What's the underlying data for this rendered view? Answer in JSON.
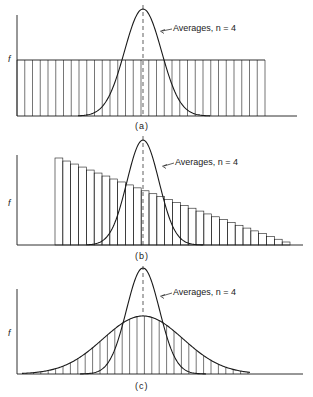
{
  "panels": [
    {
      "id": "a",
      "caption": "(a)",
      "y_label": "f",
      "annotation": "Averages, n = 4",
      "distribution": "uniform"
    },
    {
      "id": "b",
      "caption": "(b)",
      "y_label": "f",
      "annotation": "Averages, n = 4",
      "distribution": "skewed-decreasing"
    },
    {
      "id": "c",
      "caption": "(c)",
      "y_label": "f",
      "annotation": "Averages, n = 4",
      "distribution": "normal"
    }
  ],
  "colors": {
    "ink": "#1a1a1a",
    "background": "#ffffff"
  }
}
